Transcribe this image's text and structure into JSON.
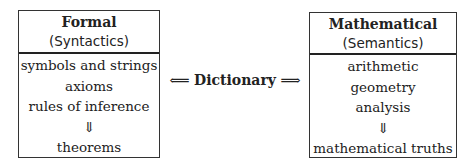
{
  "left_box": {
    "title": "Formal",
    "subtitle": "(Syntactics)",
    "items": [
      "symbols and strings",
      "axioms",
      "rules of inference"
    ],
    "arrow": "⇓",
    "result": "theorems"
  },
  "right_box": {
    "title": "Mathematical",
    "subtitle": "(Semantics)",
    "items": [
      "arithmetic",
      "geometry",
      "analysis"
    ],
    "arrow": "⇓",
    "result": "mathematical truths"
  },
  "connector": {
    "left_arrow": "⟸",
    "label": "Dictionary",
    "right_arrow": "⟹"
  }
}
